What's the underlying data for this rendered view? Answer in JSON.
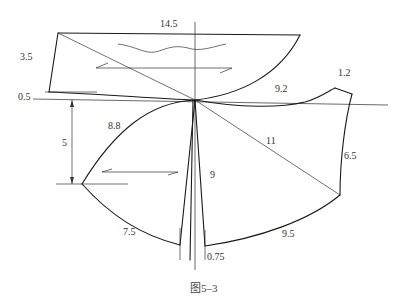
{
  "figure": {
    "caption": "图5–3",
    "type": "pattern drafting diagram (garment collar/sleeve draft)"
  },
  "labels": {
    "top_width": "14.5",
    "left_height": "3.5",
    "left_offset": "0.5",
    "vertical_drop": "5",
    "upper_curve": "8.8",
    "right_curve": "9.2",
    "right_tip": "1.2",
    "diagonal": "11",
    "right_side": "6.5",
    "center_length": "9",
    "bottom_left_curve": "7.5",
    "bottom_right_curve": "9.5",
    "dart_width": "0.75"
  },
  "colors": {
    "line": "#1a1a1a",
    "guide": "#444444",
    "text": "#333333",
    "background": "#ffffff"
  }
}
